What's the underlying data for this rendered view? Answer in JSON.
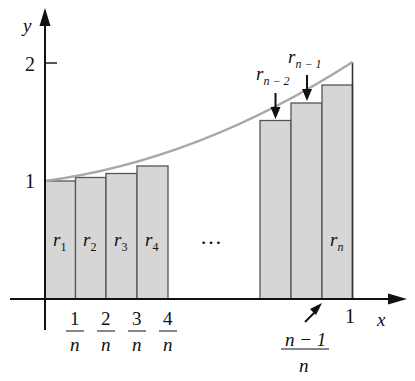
{
  "figure": {
    "axes": {
      "x_label": "x",
      "y_label": "y",
      "y_ticks": [
        {
          "label": "1",
          "value": 1
        },
        {
          "label": "2",
          "value": 2
        }
      ],
      "x_end_label": "1"
    },
    "x_fraction_labels": [
      {
        "num": "1",
        "den": "n"
      },
      {
        "num": "2",
        "den": "n"
      },
      {
        "num": "3",
        "den": "n"
      },
      {
        "num": "4",
        "den": "n"
      }
    ],
    "last_fraction_label": {
      "num": "n − 1",
      "den": "n"
    },
    "ellipsis": "…",
    "rect_labels_left": [
      {
        "base": "r",
        "sub": "1"
      },
      {
        "base": "r",
        "sub": "2"
      },
      {
        "base": "r",
        "sub": "3"
      },
      {
        "base": "r",
        "sub": "4"
      }
    ],
    "rect_label_last": {
      "base": "r",
      "sub": "n"
    },
    "arrow_labels": [
      {
        "base": "r",
        "sub": "n − 2"
      },
      {
        "base": "r",
        "sub": "n − 1"
      }
    ],
    "colors": {
      "rect_fill": "#d6d6d6",
      "rect_stroke": "#555555",
      "curve": "#a8a8a8",
      "axis": "#111111"
    }
  }
}
